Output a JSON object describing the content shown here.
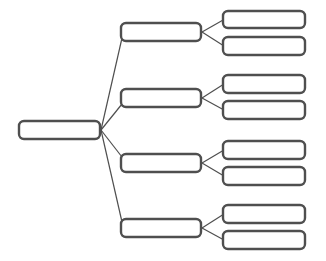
{
  "diagram": {
    "type": "tree-mindmap",
    "colors": {
      "stroke": "#4f4f4f",
      "fill": "#ffffff",
      "background": "#ffffff"
    },
    "root": {
      "id": "root",
      "label": "",
      "x": 19,
      "y": 121,
      "w": 81,
      "h": 18
    },
    "branches": [
      {
        "id": "b1",
        "label": "",
        "x": 121,
        "y": 23,
        "w": 80,
        "h": 18,
        "children": [
          {
            "id": "b1c1",
            "label": "",
            "x": 223,
            "y": 11,
            "w": 82,
            "h": 17
          },
          {
            "id": "b1c2",
            "label": "",
            "x": 223,
            "y": 37,
            "w": 82,
            "h": 18
          }
        ]
      },
      {
        "id": "b2",
        "label": "",
        "x": 121,
        "y": 89,
        "w": 80,
        "h": 18,
        "children": [
          {
            "id": "b2c1",
            "label": "",
            "x": 223,
            "y": 75,
            "w": 82,
            "h": 18
          },
          {
            "id": "b2c2",
            "label": "",
            "x": 223,
            "y": 101,
            "w": 82,
            "h": 18
          }
        ]
      },
      {
        "id": "b3",
        "label": "",
        "x": 121,
        "y": 154,
        "w": 80,
        "h": 18,
        "children": [
          {
            "id": "b3c1",
            "label": "",
            "x": 223,
            "y": 141,
            "w": 82,
            "h": 18
          },
          {
            "id": "b3c2",
            "label": "",
            "x": 223,
            "y": 167,
            "w": 82,
            "h": 18
          }
        ]
      },
      {
        "id": "b4",
        "label": "",
        "x": 121,
        "y": 219,
        "w": 80,
        "h": 18,
        "children": [
          {
            "id": "b4c1",
            "label": "",
            "x": 223,
            "y": 205,
            "w": 82,
            "h": 18
          },
          {
            "id": "b4c2",
            "label": "",
            "x": 223,
            "y": 231,
            "w": 82,
            "h": 18
          }
        ]
      }
    ]
  }
}
